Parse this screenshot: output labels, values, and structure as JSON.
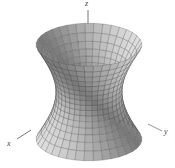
{
  "figure": {
    "type": "3d-surface",
    "surface": "hyperboloid of one sheet",
    "axes": {
      "x_label": "x",
      "y_label": "y",
      "z_label": "z"
    },
    "colors": {
      "surface_light": "#e6e6e6",
      "surface_dark": "#7a7a7a",
      "mesh": "#4a4a4a",
      "axis": "#555555",
      "background": "#ffffff"
    },
    "mesh": {
      "u_lines": 36,
      "v_lines": 16
    }
  }
}
